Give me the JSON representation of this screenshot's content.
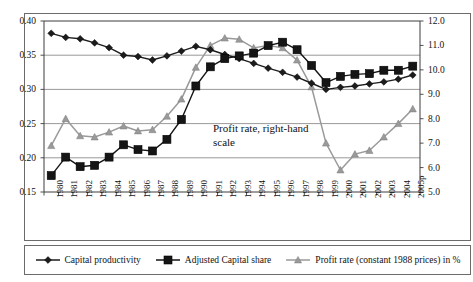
{
  "chart_data": {
    "type": "line",
    "title": "",
    "xlabel": "",
    "ylabel": "",
    "grid": true,
    "legend_position": "bottom",
    "categories": [
      "1980",
      "1981",
      "1982",
      "1983",
      "1984",
      "1985",
      "1986",
      "1987",
      "1988",
      "1989",
      "1990",
      "1991",
      "1992",
      "1993",
      "1994",
      "1995",
      "1996",
      "1997",
      "1998",
      "1999",
      "2000",
      "2001",
      "2002",
      "2003",
      "2004",
      "2005p"
    ],
    "axes": {
      "left": {
        "label": "",
        "ticks": [
          "0.15",
          "0.20",
          "0.25",
          "0.30",
          "0.35",
          "0.40"
        ],
        "ylim": [
          0.15,
          0.4
        ],
        "tick_step": 0.05
      },
      "right": {
        "label": "",
        "ticks": [
          "5.0",
          "6.0",
          "7.0",
          "8.0",
          "9.0",
          "10.0",
          "11.0",
          "12.0"
        ],
        "ylim": [
          5.0,
          12.0
        ],
        "tick_step": 1.0
      }
    },
    "annotations": [
      {
        "text": "Profit rate, right-hand scale",
        "x_category": "1993",
        "note": "points to the grey triangle series on the right axis"
      }
    ],
    "series": [
      {
        "name": "Capital productivity",
        "axis": "left",
        "marker": "diamond",
        "color": "#1c1c1c",
        "values": [
          0.382,
          0.376,
          0.374,
          0.368,
          0.361,
          0.35,
          0.348,
          0.343,
          0.349,
          0.356,
          0.363,
          0.358,
          0.351,
          0.345,
          0.338,
          0.331,
          0.325,
          0.318,
          0.309,
          0.3,
          0.303,
          0.305,
          0.308,
          0.311,
          0.315,
          0.321
        ]
      },
      {
        "name": "Adjusted Capital share",
        "axis": "left",
        "marker": "square",
        "color": "#151515",
        "values": [
          0.174,
          0.201,
          0.187,
          0.189,
          0.201,
          0.219,
          0.212,
          0.21,
          0.227,
          0.256,
          0.305,
          0.333,
          0.345,
          0.349,
          0.353,
          0.364,
          0.369,
          0.358,
          0.335,
          0.31,
          0.319,
          0.322,
          0.323,
          0.328,
          0.328,
          0.334
        ]
      },
      {
        "name": "Profit rate (constant 1988 prices) in %",
        "axis": "right",
        "marker": "triangle",
        "color": "#9a9a9a",
        "values": [
          6.9,
          8.0,
          7.3,
          7.25,
          7.45,
          7.7,
          7.5,
          7.55,
          8.1,
          8.8,
          10.1,
          11.0,
          11.3,
          11.25,
          10.9,
          11.0,
          10.9,
          10.4,
          9.3,
          7.0,
          5.9,
          6.55,
          6.7,
          7.25,
          7.8,
          8.4
        ]
      }
    ]
  },
  "legend": {
    "items": [
      {
        "label": "Capital productivity",
        "marker": "diamond",
        "color": "#1c1c1c"
      },
      {
        "label": "Adjusted Capital share",
        "marker": "square",
        "color": "#151515"
      },
      {
        "label": "Profit rate (constant 1988 prices) in %",
        "marker": "triangle",
        "color": "#9a9a9a"
      }
    ]
  }
}
